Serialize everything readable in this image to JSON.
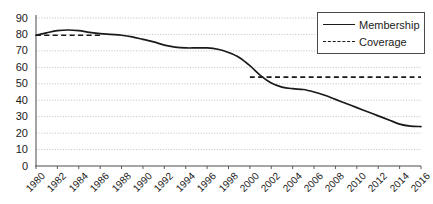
{
  "chart_data": {
    "type": "line",
    "title": "",
    "xlabel": "",
    "ylabel": "",
    "xlim": [
      1980,
      2016
    ],
    "ylim": [
      0,
      90
    ],
    "grid": true,
    "grid_style": "dotted-horizontal",
    "legend_position": "top-right",
    "ytick_labels": [
      "90",
      "80",
      "70",
      "60",
      "50",
      "40",
      "30",
      "20",
      "10",
      "0"
    ],
    "yticks": [
      90,
      80,
      70,
      60,
      50,
      40,
      30,
      20,
      10,
      0
    ],
    "xtick_labels": [
      "1980",
      "1982",
      "1984",
      "1986",
      "1988",
      "1990",
      "1992",
      "1994",
      "1996",
      "1998",
      "2000",
      "2002",
      "2004",
      "2006",
      "2008",
      "2010",
      "2012",
      "2014",
      "2016"
    ],
    "xticks": [
      1980,
      1982,
      1984,
      1986,
      1988,
      1990,
      1992,
      1994,
      1996,
      1998,
      2000,
      2002,
      2004,
      2006,
      2008,
      2010,
      2012,
      2014,
      2016
    ],
    "series": [
      {
        "name": "Membership",
        "style": "solid",
        "color": "#1a1a1a",
        "x": [
          1980,
          1981,
          1982,
          1983,
          1984,
          1985,
          1986,
          1987,
          1988,
          1989,
          1990,
          1991,
          1992,
          1993,
          1994,
          1995,
          1996,
          1997,
          1998,
          1999,
          2000,
          2001,
          2002,
          2003,
          2004,
          2005,
          2006,
          2007,
          2008,
          2009,
          2010,
          2011,
          2012,
          2013,
          2014,
          2015,
          2016
        ],
        "values": [
          79.5,
          81.0,
          82.3,
          82.7,
          82.3,
          81.3,
          80.5,
          80.0,
          79.5,
          78.5,
          77.0,
          75.5,
          73.5,
          72.3,
          71.8,
          71.8,
          71.8,
          71.0,
          69.0,
          66.0,
          61.0,
          55.0,
          50.5,
          48.0,
          47.0,
          46.5,
          45.0,
          43.0,
          40.5,
          38.0,
          35.5,
          33.0,
          30.5,
          28.0,
          25.5,
          24.3,
          24.0
        ],
        "values_note": "percent"
      },
      {
        "name": "Coverage",
        "style": "dashed",
        "color": "#1a1a1a",
        "segments": [
          {
            "x": [
              1980,
              1986
            ],
            "values": [
              79.5,
              79.5
            ]
          },
          {
            "x": [
              2000,
              2016
            ],
            "values": [
              54.0,
              54.0
            ]
          }
        ]
      }
    ]
  },
  "legend": {
    "entries": [
      {
        "label": "Membership",
        "style": "solid"
      },
      {
        "label": "Coverage",
        "style": "dashed"
      }
    ]
  }
}
